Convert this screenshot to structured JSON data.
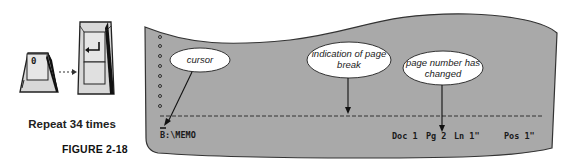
{
  "keys": {
    "first_key": {
      "label": "0",
      "name": "zero-key"
    },
    "second_key": {
      "label": "↵",
      "name": "enter-key"
    },
    "connector": "dotted-arrow"
  },
  "caption": "Repeat 34 times",
  "figure_label": "FIGURE 2-18",
  "screen": {
    "background_color": "#a9a9a9",
    "page_break_style": "dashed",
    "path_text": "B:\\MEMO",
    "status": {
      "doc": "Doc 1",
      "pg": "Pg 2",
      "ln": "Ln 1\"",
      "pos": "Pos 1\""
    }
  },
  "callouts": [
    {
      "id": "cursor",
      "text": "cursor"
    },
    {
      "id": "page-break",
      "text": "indication of page break",
      "line1": "indication of page",
      "line2": "break"
    },
    {
      "id": "page-number",
      "text": "page number has changed",
      "line1": "page number has",
      "line2": "changed"
    }
  ]
}
